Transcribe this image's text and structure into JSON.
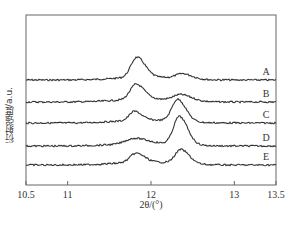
{
  "chart_data": {
    "type": "line",
    "title": "",
    "xlabel": "2θ/(°)",
    "ylabel": "衍射强度/a.u.",
    "xlim": [
      10.5,
      13.5
    ],
    "xticks": [
      10.5,
      11,
      12,
      13,
      13.5
    ],
    "xtick_labels": [
      "10.5",
      "11",
      "12",
      "13",
      "13.5"
    ],
    "yticks": [],
    "grid": false,
    "legend": "inline labels at right end of each curve",
    "series": [
      {
        "name": "A",
        "baseline": 80,
        "peaks": [
          {
            "x": 11.83,
            "height": 20,
            "width": 0.07
          },
          {
            "x": 12.38,
            "height": 5,
            "width": 0.08
          }
        ]
      },
      {
        "name": "B",
        "baseline": 102,
        "peaks": [
          {
            "x": 11.82,
            "height": 15,
            "width": 0.07
          },
          {
            "x": 12.36,
            "height": 6,
            "width": 0.09
          }
        ]
      },
      {
        "name": "C",
        "baseline": 123,
        "peaks": [
          {
            "x": 11.8,
            "height": 9,
            "width": 0.06
          },
          {
            "x": 12.32,
            "height": 22,
            "width": 0.07
          }
        ]
      },
      {
        "name": "D",
        "baseline": 146,
        "peaks": [
          {
            "x": 11.8,
            "height": 5,
            "width": 0.1
          },
          {
            "x": 12.34,
            "height": 28,
            "width": 0.07
          }
        ]
      },
      {
        "name": "E",
        "baseline": 165,
        "peaks": [
          {
            "x": 11.82,
            "height": 9,
            "width": 0.07
          },
          {
            "x": 12.36,
            "height": 14,
            "width": 0.07
          }
        ]
      }
    ]
  },
  "plot": {
    "left": 26,
    "top": 15,
    "right": 276,
    "bottom": 185,
    "line_color": "#333333",
    "frame_color": "#555555"
  }
}
